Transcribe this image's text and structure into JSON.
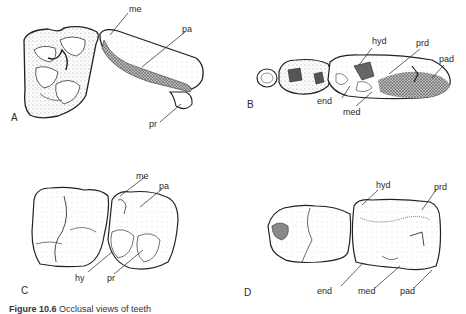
{
  "figure": {
    "panels": [
      {
        "id": "A",
        "letter": "A",
        "labels": {
          "me": "me",
          "pa": "pa",
          "pr": "pr"
        }
      },
      {
        "id": "B",
        "letter": "B",
        "labels": {
          "hyd": "hyd",
          "prd": "prd",
          "pad": "pad",
          "end": "end",
          "med": "med"
        }
      },
      {
        "id": "C",
        "letter": "C",
        "labels": {
          "me": "me",
          "pa": "pa",
          "hy": "hy",
          "pr": "pr"
        }
      },
      {
        "id": "D",
        "letter": "D",
        "labels": {
          "hyd": "hyd",
          "prd": "prd",
          "end": "end",
          "med": "med",
          "pad": "pad"
        }
      }
    ],
    "caption": {
      "number": "Figure 10.6",
      "text": "Occlusal views of teeth"
    },
    "colors": {
      "ink": "#2a2a2a",
      "stipple": "#8a8a8a",
      "background": "#ffffff"
    }
  }
}
